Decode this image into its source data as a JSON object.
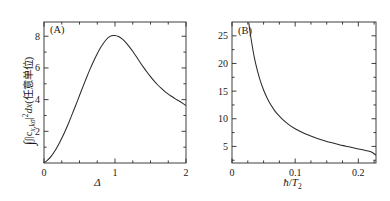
{
  "figure": {
    "panel_a_tag": "(A)",
    "panel_b_tag": "(B)",
    "ylabel_a_prefix": "∫|c",
    "ylabel_a_sub": "x,kσ",
    "ylabel_a_mid": "|",
    "ylabel_a_exp": "2",
    "ylabel_a_dx": "dx",
    "ylabel_a_units": "(任意单位)",
    "xlabel_a": "Δ",
    "xlabel_b_num": "ħ",
    "xlabel_b_slash": "/",
    "xlabel_b_denom": "T",
    "xlabel_b_sub": "2",
    "curve_color": "#2b2b2b",
    "axis_color": "#2b2b2b",
    "background": "#ffffff"
  },
  "chart_data": [
    {
      "type": "line",
      "title": "(A)",
      "xlabel": "Δ",
      "ylabel": "∫|c_{x,kσ}|²dx (arbitrary units)",
      "xlim": [
        0,
        2.0
      ],
      "ylim": [
        0,
        8.9
      ],
      "xticks": [
        0,
        1,
        2
      ],
      "xtick_labels": [
        "0",
        "1",
        "2"
      ],
      "xticks_minor": [
        0.25,
        0.5,
        0.75,
        1.25,
        1.5,
        1.75
      ],
      "yticks": [
        2,
        4,
        6,
        8
      ],
      "ytick_labels": [
        "2",
        "4",
        "6",
        "8"
      ],
      "yticks_minor": [
        1,
        3,
        5,
        7
      ],
      "grid": false,
      "legend": "none",
      "x": [
        0.0,
        0.05,
        0.1,
        0.15,
        0.2,
        0.25,
        0.3,
        0.35,
        0.4,
        0.45,
        0.5,
        0.55,
        0.6,
        0.65,
        0.7,
        0.75,
        0.8,
        0.85,
        0.9,
        0.95,
        1.0,
        1.05,
        1.1,
        1.15,
        1.2,
        1.25,
        1.3,
        1.35,
        1.4,
        1.45,
        1.5,
        1.55,
        1.6,
        1.65,
        1.7,
        1.75,
        1.8,
        1.85,
        1.9,
        1.95,
        2.0
      ],
      "values": [
        0.0,
        0.18,
        0.42,
        0.74,
        1.12,
        1.56,
        2.04,
        2.56,
        3.12,
        3.68,
        4.26,
        4.84,
        5.4,
        5.94,
        6.44,
        6.9,
        7.3,
        7.64,
        7.9,
        8.03,
        8.05,
        7.98,
        7.83,
        7.62,
        7.35,
        7.05,
        6.72,
        6.38,
        6.05,
        5.74,
        5.45,
        5.18,
        4.94,
        4.72,
        4.52,
        4.35,
        4.2,
        4.05,
        3.92,
        3.78,
        3.62
      ]
    },
    {
      "type": "line",
      "title": "(B)",
      "xlabel": "ħ/T₂",
      "ylabel": "",
      "xlim": [
        0,
        0.228
      ],
      "ylim": [
        2.0,
        27.5
      ],
      "xticks": [
        0,
        0.1,
        0.2
      ],
      "xtick_labels": [
        "0",
        "0.1",
        "0.2"
      ],
      "xticks_minor": [
        0.025,
        0.05,
        0.075,
        0.125,
        0.15,
        0.175,
        0.225
      ],
      "yticks": [
        5,
        10,
        15,
        20,
        25
      ],
      "ytick_labels": [
        "5",
        "10",
        "15",
        "20",
        "25"
      ],
      "yticks_minor": [
        2.5,
        7.5,
        12.5,
        17.5,
        22.5
      ],
      "grid": false,
      "legend": "none",
      "x": [
        0.0265,
        0.03,
        0.035,
        0.04,
        0.045,
        0.05,
        0.055,
        0.06,
        0.065,
        0.07,
        0.08,
        0.09,
        0.1,
        0.11,
        0.12,
        0.13,
        0.14,
        0.15,
        0.16,
        0.17,
        0.18,
        0.19,
        0.2,
        0.21,
        0.22,
        0.228
      ],
      "values": [
        27.4,
        24.6,
        21.3,
        18.8,
        16.8,
        15.2,
        13.9,
        12.8,
        11.9,
        11.1,
        9.9,
        8.95,
        8.2,
        7.6,
        7.1,
        6.65,
        6.25,
        5.9,
        5.6,
        5.3,
        5.05,
        4.8,
        4.55,
        4.3,
        4.05,
        3.4
      ]
    }
  ]
}
